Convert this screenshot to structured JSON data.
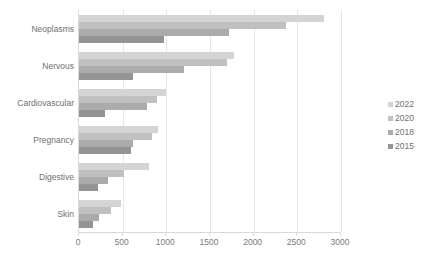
{
  "chart_data": {
    "type": "bar",
    "orientation": "horizontal",
    "title": "",
    "xlabel": "",
    "ylabel": "",
    "xlim": [
      0,
      3000
    ],
    "xticks": [
      0,
      500,
      1000,
      1500,
      2000,
      2500,
      3000
    ],
    "xtick_labels": [
      "0",
      "500",
      "1000",
      "1500",
      "2000",
      "2500",
      "3000"
    ],
    "grid": true,
    "grid_axis": "x",
    "legend_position": "right",
    "categories": [
      "Neoplasms",
      "Nervous",
      "Cardiovascular",
      "Pregnancy",
      "Digestive",
      "Skin"
    ],
    "series": [
      {
        "name": "2022",
        "color": "#d4d4d4",
        "values": [
          2800,
          1780,
          1000,
          900,
          800,
          480
        ]
      },
      {
        "name": "2020",
        "color": "#c0c0c0",
        "values": [
          2370,
          1690,
          890,
          840,
          520,
          370
        ]
      },
      {
        "name": "2018",
        "color": "#ababab",
        "values": [
          1720,
          1200,
          780,
          620,
          330,
          230
        ]
      },
      {
        "name": "2015",
        "color": "#949494",
        "values": [
          970,
          620,
          300,
          600,
          220,
          160
        ]
      }
    ]
  },
  "legend": {
    "entries": [
      {
        "label": "2022",
        "color": "#d4d4d4"
      },
      {
        "label": "2020",
        "color": "#c0c0c0"
      },
      {
        "label": "2018",
        "color": "#ababab"
      },
      {
        "label": "2015",
        "color": "#949494"
      }
    ]
  },
  "axis": {
    "x_tick_labels": [
      "0",
      "500",
      "1000",
      "1500",
      "2000",
      "2500",
      "3000"
    ],
    "y_tick_labels": [
      "Neoplasms",
      "Nervous",
      "Cardiovascular",
      "Pregnancy",
      "Digestive",
      "Skin"
    ]
  }
}
